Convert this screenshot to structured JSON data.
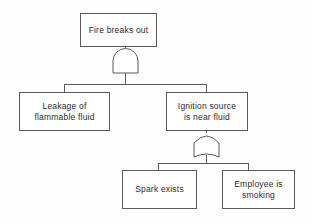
{
  "diagram": {
    "type": "fault-tree",
    "background_color": "#fdfdfd",
    "line_color": "#5a5a5a",
    "text_color": "#2b2b2b"
  },
  "nodes": {
    "top_event": {
      "label": "Fire breaks out",
      "x": 80,
      "y": 13,
      "w": 77,
      "h": 34
    },
    "leakage": {
      "label": "Leakage of\nflammable fluid",
      "x": 19,
      "y": 92,
      "w": 91,
      "h": 39
    },
    "ignition": {
      "label": "Ignition source\nis near fluid",
      "x": 166,
      "y": 92,
      "w": 82,
      "h": 39
    },
    "spark": {
      "label": "Spark exists",
      "x": 122,
      "y": 170,
      "w": 75,
      "h": 39
    },
    "smoking": {
      "label": "Employee is\nsmoking",
      "x": 222,
      "y": 170,
      "w": 73,
      "h": 39
    }
  },
  "gates": {
    "and_gate": {
      "kind": "AND",
      "icon": "and-gate-icon",
      "x": 110,
      "y": 47,
      "w": 30,
      "h": 30
    },
    "or_gate": {
      "kind": "OR",
      "icon": "or-gate-icon",
      "x": 192,
      "y": 131,
      "w": 30,
      "h": 30
    }
  },
  "connections": [
    {
      "from": "and_gate",
      "to": "leakage"
    },
    {
      "from": "and_gate",
      "to": "ignition"
    },
    {
      "from": "or_gate",
      "to": "spark"
    },
    {
      "from": "or_gate",
      "to": "smoking"
    }
  ]
}
